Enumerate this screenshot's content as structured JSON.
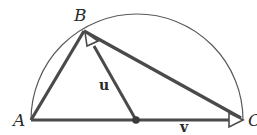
{
  "diagram": {
    "points": {
      "A": {
        "label": "A"
      },
      "B": {
        "label": "B"
      },
      "C": {
        "label": "C"
      },
      "O": {
        "label": ""
      }
    },
    "vectors": {
      "u": {
        "label": "u",
        "from": "O",
        "to": "B"
      },
      "v": {
        "label": "v",
        "from": "O",
        "to": "C"
      }
    },
    "segments": [
      {
        "from": "A",
        "to": "B"
      },
      {
        "from": "B",
        "to": "C"
      },
      {
        "from": "A",
        "to": "C"
      }
    ],
    "colors": {
      "stroke": "#4a4a4a",
      "arc": "#5a5a5a",
      "text": "#2a2a2a",
      "background": "#ffffff"
    }
  }
}
